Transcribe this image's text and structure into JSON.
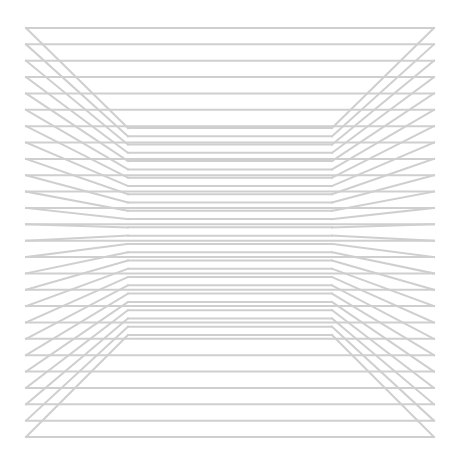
{
  "artwork": {
    "type": "op-art line perspective",
    "stroke_color": "#cfcfcf",
    "background": "#ffffff",
    "line_count": 26,
    "outer": {
      "x_left": 26,
      "x_right": 434,
      "y_top": 28,
      "y_bottom": 437
    },
    "inner": {
      "x_left": 128,
      "x_right": 332,
      "y_top": 128,
      "y_bottom": 335
    },
    "stroke_width": 2
  }
}
